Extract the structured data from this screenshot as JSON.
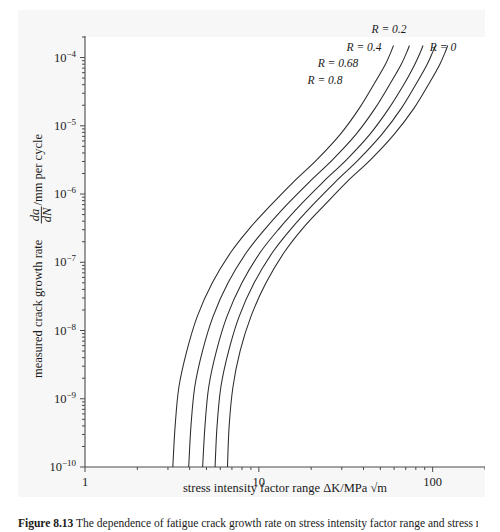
{
  "figure": {
    "caption_number": "Figure 8.13",
    "caption_text": "The dependence of fatigue crack growth rate on stress intensity factor range and stress ratio R.",
    "panel_background": "#f7f7f7",
    "plot_background": "#ffffff",
    "curve_color": "#2b2b2b",
    "axis_color": "#4a4a4a"
  },
  "chart_data": {
    "type": "line",
    "title": "",
    "xlabel": "stress intensity factor range ΔK/MPa √m",
    "ylabel": "measured crack growth rate da/dN /mm per cycle",
    "xscale": "log",
    "yscale": "log",
    "xlim": [
      1,
      200
    ],
    "ylim": [
      1e-10,
      0.0002
    ],
    "grid": false,
    "legend_position": "inline-annotations",
    "xticks": [
      1,
      10,
      100
    ],
    "xticklabels": [
      "1",
      "10",
      "100"
    ],
    "yticks": [
      0.0001,
      1e-05,
      1e-06,
      1e-07,
      1e-08,
      1e-09,
      1e-10
    ],
    "yticklabels": [
      "10−4",
      "10−5",
      "10−6",
      "10−7",
      "10−8",
      "10−9",
      "10−10"
    ],
    "ytick_exponents": [
      "-4",
      "-5",
      "-6",
      "-7",
      "-8",
      "-9",
      "-10"
    ],
    "series": [
      {
        "name": "R = 0",
        "label": "R = 0",
        "threshold_dK": 6.6,
        "x": [
          6.6,
          6.75,
          7.1,
          7.8,
          9.0,
          11.0,
          14.0,
          18.0,
          24.0,
          32.0,
          44.0,
          60.0,
          78.0,
          97.0,
          110.0,
          118.0,
          122.0
        ],
        "y": [
          1e-10,
          4e-10,
          1.5e-09,
          5e-09,
          1.6e-08,
          5e-08,
          1.4e-07,
          3.2e-07,
          7e-07,
          1.5e-06,
          3.2e-06,
          7.5e-06,
          1.8e-05,
          4.5e-05,
          8e-05,
          0.00012,
          0.00015
        ]
      },
      {
        "name": "R = 0.2",
        "label": "R = 0.2",
        "threshold_dK": 5.6,
        "x": [
          5.6,
          5.75,
          6.05,
          6.7,
          7.7,
          9.4,
          12.0,
          15.5,
          20.5,
          27.5,
          37.5,
          51.0,
          66.0,
          82.0,
          93.0,
          100.0,
          104.0
        ],
        "y": [
          1e-10,
          4e-10,
          1.5e-09,
          5e-09,
          1.6e-08,
          5e-08,
          1.4e-07,
          3.2e-07,
          7e-07,
          1.5e-06,
          3.2e-06,
          7.5e-06,
          1.8e-05,
          4.5e-05,
          8e-05,
          0.00012,
          0.00015
        ]
      },
      {
        "name": "R = 0.4",
        "label": "R = 0.4",
        "threshold_dK": 4.75,
        "x": [
          4.75,
          4.9,
          5.15,
          5.7,
          6.55,
          8.0,
          10.2,
          13.2,
          17.4,
          23.4,
          32.0,
          43.5,
          56.0,
          70.0,
          79.0,
          85.0,
          88.0
        ],
        "y": [
          1e-10,
          4e-10,
          1.5e-09,
          5e-09,
          1.6e-08,
          5e-08,
          1.4e-07,
          3.2e-07,
          7e-07,
          1.5e-06,
          3.2e-06,
          7.5e-06,
          1.8e-05,
          4.5e-05,
          8e-05,
          0.00012,
          0.00015
        ]
      },
      {
        "name": "R = 0.68",
        "label": "R = 0.68",
        "threshold_dK": 3.95,
        "x": [
          3.95,
          4.07,
          4.28,
          4.74,
          5.45,
          6.65,
          8.5,
          11.0,
          14.5,
          19.5,
          26.6,
          36.2,
          46.6,
          58.0,
          66.0,
          71.0,
          73.5
        ],
        "y": [
          1e-10,
          4e-10,
          1.5e-09,
          5e-09,
          1.6e-08,
          5e-08,
          1.4e-07,
          3.2e-07,
          7e-07,
          1.5e-06,
          3.2e-06,
          7.5e-06,
          1.8e-05,
          4.5e-05,
          8e-05,
          0.00012,
          0.00015
        ]
      },
      {
        "name": "R = 0.8",
        "label": "R = 0.8",
        "threshold_dK": 3.2,
        "x": [
          3.2,
          3.3,
          3.47,
          3.85,
          4.42,
          5.4,
          6.9,
          8.9,
          11.8,
          15.8,
          21.6,
          29.4,
          37.8,
          47.0,
          53.5,
          57.5,
          59.5
        ],
        "y": [
          1e-10,
          4e-10,
          1.5e-09,
          5e-09,
          1.6e-08,
          5e-08,
          1.4e-07,
          3.2e-07,
          7e-07,
          1.5e-06,
          3.2e-06,
          7.5e-06,
          1.8e-05,
          4.5e-05,
          8e-05,
          0.00012,
          0.00015
        ]
      }
    ],
    "annotations": [
      {
        "text": "R = 0.2",
        "x_px": 389,
        "y_px": 33
      },
      {
        "text": "R = 0.4",
        "x_px": 364,
        "y_px": 51
      },
      {
        "text": "R = 0.68",
        "x_px": 338,
        "y_px": 67
      },
      {
        "text": "R = 0.8",
        "x_px": 325,
        "y_px": 84
      },
      {
        "text": "R = 0",
        "x_px": 443,
        "y_px": 51
      }
    ]
  }
}
